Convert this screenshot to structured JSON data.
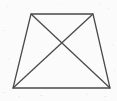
{
  "figure": {
    "name": "trapezoid-with-diagonals",
    "canvas": {
      "width": 117,
      "height": 101
    },
    "background_color": "#fbfbfb",
    "stroke_color": "#4a4a4a",
    "stroke_width": 1.3,
    "vertices": {
      "top_left": {
        "x": 31,
        "y": 14
      },
      "top_right": {
        "x": 93,
        "y": 14
      },
      "bottom_right": {
        "x": 110,
        "y": 88
      },
      "bottom_left": {
        "x": 13,
        "y": 88
      }
    },
    "diagonal_intersection": {
      "x": 60,
      "y": 48
    },
    "edges": [
      {
        "name": "top-edge",
        "from": "top_left",
        "to": "top_right"
      },
      {
        "name": "right-edge",
        "from": "top_right",
        "to": "bottom_right"
      },
      {
        "name": "bottom-edge",
        "from": "bottom_right",
        "to": "bottom_left"
      },
      {
        "name": "left-edge",
        "from": "bottom_left",
        "to": "top_left"
      }
    ],
    "diagonals": [
      {
        "name": "diagonal-tl-br",
        "from": "top_left",
        "to": "bottom_right"
      },
      {
        "name": "diagonal-tr-bl",
        "from": "top_right",
        "to": "bottom_left"
      }
    ],
    "outline_points": "31,14 93,14 110,88 13,88",
    "diagonal_1_points": "31,14 110,88",
    "diagonal_2_points": "93,14 13,88",
    "labels": [],
    "noise_specks": [
      {
        "x": 3,
        "y": 30,
        "w": 2,
        "h": 1,
        "o": 0.05
      },
      {
        "x": 8,
        "y": 58,
        "w": 1,
        "h": 2,
        "o": 0.04
      },
      {
        "x": 2,
        "y": 92,
        "w": 3,
        "h": 1,
        "o": 0.06
      },
      {
        "x": 18,
        "y": 96,
        "w": 2,
        "h": 1,
        "o": 0.05
      },
      {
        "x": 40,
        "y": 95,
        "w": 3,
        "h": 1,
        "o": 0.05
      },
      {
        "x": 63,
        "y": 97,
        "w": 2,
        "h": 1,
        "o": 0.04
      },
      {
        "x": 86,
        "y": 94,
        "w": 2,
        "h": 1,
        "o": 0.05
      },
      {
        "x": 104,
        "y": 96,
        "w": 3,
        "h": 1,
        "o": 0.05
      },
      {
        "x": 112,
        "y": 44,
        "w": 1,
        "h": 2,
        "o": 0.04
      },
      {
        "x": 108,
        "y": 8,
        "w": 2,
        "h": 1,
        "o": 0.04
      },
      {
        "x": 99,
        "y": 3,
        "w": 1,
        "h": 2,
        "o": 0.04
      },
      {
        "x": 60,
        "y": 4,
        "w": 2,
        "h": 1,
        "o": 0.03
      },
      {
        "x": 24,
        "y": 2,
        "w": 1,
        "h": 1,
        "o": 0.04
      },
      {
        "x": 6,
        "y": 6,
        "w": 2,
        "h": 1,
        "o": 0.04
      },
      {
        "x": 114,
        "y": 70,
        "w": 1,
        "h": 2,
        "o": 0.04
      }
    ]
  }
}
